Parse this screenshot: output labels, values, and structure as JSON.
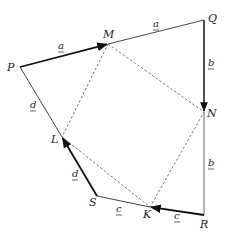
{
  "diagram": {
    "vertices": {
      "P": {
        "label": "P",
        "x": 20,
        "y": 67
      },
      "M": {
        "label": "M",
        "x": 108,
        "y": 44
      },
      "Q": {
        "label": "Q",
        "x": 204,
        "y": 20
      },
      "N": {
        "label": "N",
        "x": 204,
        "y": 112
      },
      "R": {
        "label": "R",
        "x": 204,
        "y": 215
      },
      "K": {
        "label": "K",
        "x": 150,
        "y": 207
      },
      "S": {
        "label": "S",
        "x": 97,
        "y": 196
      },
      "L": {
        "label": "L",
        "x": 62,
        "y": 137
      }
    },
    "vector_labels": {
      "a_PM": "a",
      "a_MQ": "a",
      "b_QN": "b",
      "b_NR": "b",
      "c_RK": "c",
      "c_KS": "c",
      "d_SL": "d",
      "d_LP": "d"
    },
    "colors": {
      "line": "#333333",
      "bold_vector": "#111111",
      "dashed": "#555555",
      "text": "#222222"
    }
  }
}
